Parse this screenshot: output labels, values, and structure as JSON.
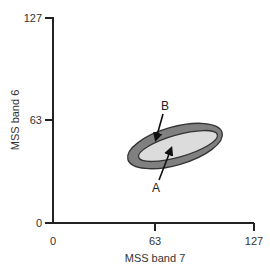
{
  "diagram": {
    "x_axis": {
      "label": "MSS band 7",
      "ticks": [
        "0",
        "63",
        "127"
      ]
    },
    "y_axis": {
      "label": "MSS band 6",
      "ticks": [
        "0",
        "63",
        "127"
      ]
    },
    "labels": {
      "a": "A",
      "b": "B"
    },
    "colors": {
      "outer_ellipse": "#808080",
      "inner_ellipse": "#dcdcdc",
      "axis": "#222222"
    }
  }
}
